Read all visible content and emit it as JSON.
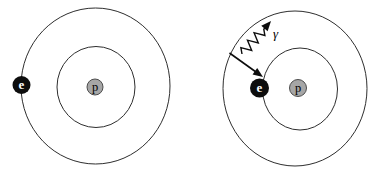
{
  "left_atom": {
    "electron_label": "e",
    "proton_label": "p"
  },
  "right_atom": {
    "electron_label": "e",
    "proton_label": "p",
    "photon_label": "γ"
  },
  "colors": {
    "background": "#ffffff",
    "orbit_stroke": "#2e2e2e",
    "electron_fill": "#0d0d0d",
    "electron_text": "#ffffff",
    "proton_fill": "#a6a6a6",
    "proton_stroke": "#4d4d4d",
    "arrow_color": "#0d0d0d"
  }
}
